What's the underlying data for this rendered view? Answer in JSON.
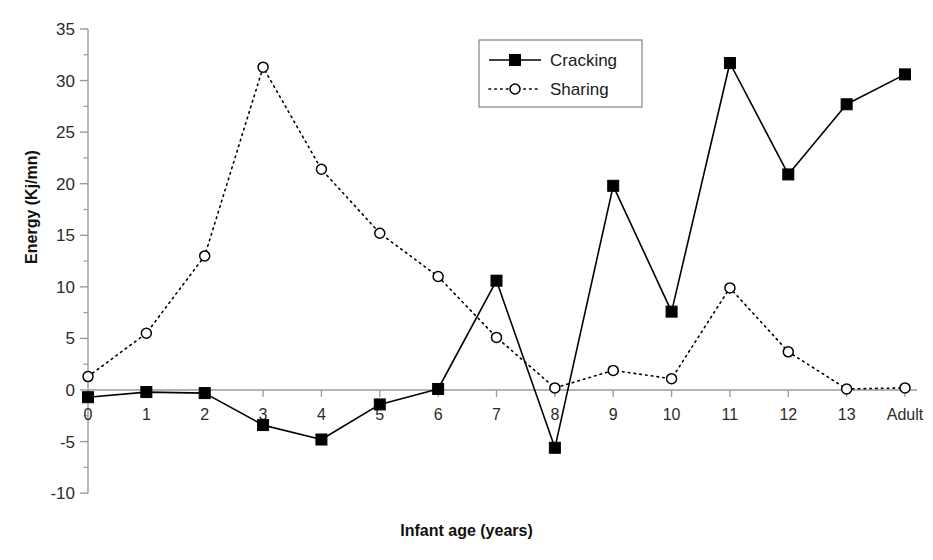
{
  "chart_data": {
    "type": "line",
    "title": "",
    "xlabel": "Infant age (years)",
    "ylabel": "Energy (Kj/mn)",
    "categories": [
      "0",
      "1",
      "2",
      "3",
      "4",
      "5",
      "6",
      "7",
      "8",
      "9",
      "10",
      "11",
      "12",
      "13",
      "Adult"
    ],
    "ylim": [
      -10,
      35
    ],
    "yticks": [
      "-10",
      "-5",
      "0",
      "5",
      "10",
      "15",
      "20",
      "25",
      "30",
      "35"
    ],
    "ytick_values": [
      -10,
      -5,
      0,
      5,
      10,
      15,
      20,
      25,
      30,
      35
    ],
    "minor_ticks": true,
    "grid": false,
    "legend_position": "top-center-right",
    "series": [
      {
        "name": "Cracking",
        "marker": "filled-square",
        "line_style": "solid",
        "color": "#000000",
        "values": [
          -0.7,
          -0.2,
          -0.3,
          -3.4,
          -4.8,
          -1.4,
          0.1,
          10.6,
          -5.6,
          19.8,
          7.6,
          31.7,
          20.9,
          27.7,
          30.6
        ]
      },
      {
        "name": "Sharing",
        "marker": "open-circle",
        "line_style": "dotted",
        "color": "#000000",
        "values": [
          1.3,
          5.5,
          13.0,
          31.3,
          21.4,
          15.2,
          11.0,
          5.1,
          0.2,
          1.9,
          1.1,
          9.9,
          3.7,
          0.1,
          0.2
        ]
      }
    ]
  },
  "legend": {
    "items": [
      {
        "label": "Cracking"
      },
      {
        "label": "Sharing"
      }
    ]
  }
}
